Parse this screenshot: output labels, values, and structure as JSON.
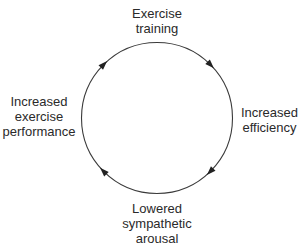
{
  "diagram": {
    "type": "cycle",
    "direction": "clockwise",
    "colors": {
      "line": "#3a3a3a",
      "text": "#2a2a2a",
      "background": "#ffffff"
    },
    "nodes": [
      {
        "id": "top",
        "lines": [
          "Exercise",
          "training"
        ]
      },
      {
        "id": "right",
        "lines": [
          "Increased",
          "efficiency"
        ]
      },
      {
        "id": "bottom",
        "lines": [
          "Lowered",
          "sympathetic",
          "arousal"
        ]
      },
      {
        "id": "left",
        "lines": [
          "Increased",
          "exercise",
          "performance"
        ]
      }
    ],
    "edges": [
      {
        "from": "top",
        "to": "right"
      },
      {
        "from": "right",
        "to": "bottom"
      },
      {
        "from": "bottom",
        "to": "left"
      },
      {
        "from": "left",
        "to": "top"
      }
    ]
  }
}
